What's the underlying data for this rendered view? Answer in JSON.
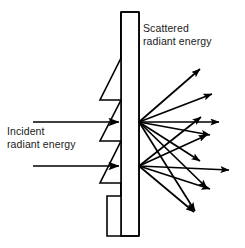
{
  "figure": {
    "type": "physics-schematic",
    "title_text_present": false,
    "background_color": "#ffffff",
    "stroke_color": "#000000",
    "text_color": "#1a1a1a",
    "width": 245,
    "height": 248,
    "labels": {
      "scattered": {
        "text": "Scattered\nradiant energy",
        "line1": "Scattered",
        "line2": "radiant energy",
        "x": 143,
        "y": 22
      },
      "incident": {
        "text": "Incident\nradiant energy",
        "line1": "Incident",
        "line2": "radiant energy",
        "x": 7,
        "y": 125
      }
    },
    "slab": {
      "description": "vertical rectangular slab with jagged sawtooth left face",
      "right_edge_x": 139,
      "body_left_x": 121,
      "top_y": 12,
      "bottom_y": 236,
      "fill": "#ffffff"
    },
    "incident_rays": [
      {
        "x1": 33,
        "y1": 122,
        "x2": 121,
        "y2": 122
      },
      {
        "x1": 33,
        "y1": 166,
        "x2": 121,
        "y2": 166
      }
    ],
    "scatter_vertices": [
      {
        "id": "upper",
        "x": 139,
        "y": 122
      },
      {
        "id": "lower",
        "x": 139,
        "y": 166
      }
    ],
    "scattered_rays": [
      {
        "from": "upper",
        "x2": 203,
        "y2": 66
      },
      {
        "from": "upper",
        "x2": 216,
        "y2": 92
      },
      {
        "from": "upper",
        "x2": 222,
        "y2": 122
      },
      {
        "from": "upper",
        "x2": 213,
        "y2": 136
      },
      {
        "from": "upper",
        "x2": 204,
        "y2": 163
      },
      {
        "from": "upper",
        "x2": 211,
        "y2": 190
      },
      {
        "from": "upper",
        "x2": 199,
        "y2": 213
      },
      {
        "from": "lower",
        "x2": 205,
        "y2": 114
      },
      {
        "from": "lower",
        "x2": 210,
        "y2": 133
      },
      {
        "from": "lower",
        "x2": 232,
        "y2": 170
      },
      {
        "from": "lower",
        "x2": 214,
        "y2": 191
      },
      {
        "from": "lower",
        "x2": 198,
        "y2": 214
      }
    ],
    "counts": {
      "incident_ray_count": 2,
      "scattered_ray_count": 12,
      "scatter_point_count": 2
    }
  }
}
